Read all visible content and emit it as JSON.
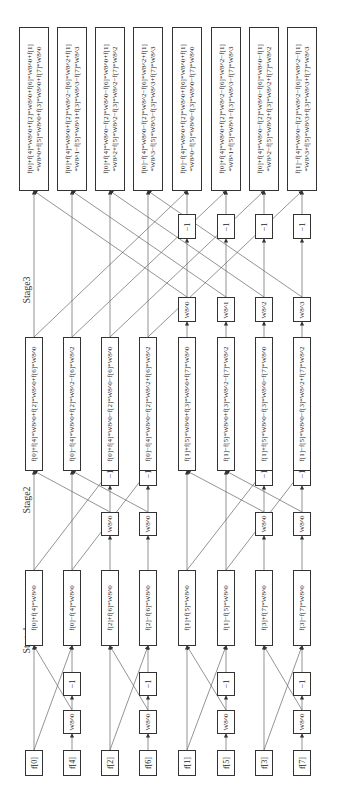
{
  "stages": {
    "stage1": "Stage1",
    "stage2": "Stage2",
    "stage3": "Stage3"
  },
  "inputs": [
    "f[0]",
    "f[4]",
    "f[2]",
    "f[6]",
    "f[1]",
    "f[5]",
    "f[3]",
    "f[7]"
  ],
  "stage1": {
    "twiddles": [
      "W8^0",
      "W8^0",
      "W8^0",
      "W8^0"
    ],
    "neg": [
      "−1",
      "−1",
      "−1",
      "−1"
    ],
    "outputs": [
      "f[0]+f[4]*W8^0",
      "f[0]−f[4]*W8^0",
      "f[2]+f[6]*W8^0",
      "f[2]−f[6]*W8^0",
      "f[1]+f[5]*W8^0",
      "f[1]−f[5]*W8^0",
      "f[3]+f[7]*W8^0",
      "f[3]−f[7]*W8^0"
    ]
  },
  "stage2": {
    "twiddles": [
      "W8^0",
      "W8^0",
      "W8^0",
      "W8^0"
    ],
    "neg": [
      "−1",
      "−1",
      "−1",
      "−1"
    ],
    "outputs": [
      "f[0]+f[4]*W8^0+f[2]*W8^0+f[6]*W8^0",
      "f[0]−f[4]*W8^0+f[2]*W8^2−f[6]*W8^2",
      "f[0]+f[4]*W8^0−f[2]*W8^0−f[6]*W8^0",
      "f[0]−f[4]*W8^0−f[2]*W8^2+f[6]*W8^2",
      "f[1]+f[5]*W8^0+f[3]*W8^0+f[7]*W8^0",
      "f[1]−f[5]*W8^0+f[3]*W8^2−f[7]*W8^2",
      "f[1]+f[5]*W8^0−f[3]*W8^0−f[7]*W8^0",
      "f[1]−f[5]*W8^0−f[3]*W8^2+f[7]*W8^2"
    ]
  },
  "stage3": {
    "twiddles": [
      "W8^0",
      "W8^1",
      "W8^2",
      "W8^3"
    ],
    "neg": [
      "−1",
      "−1",
      "−1",
      "−1"
    ],
    "outputs": [
      {
        "line1": "f[0]+f[4]*W8^0+f[2]*W8^0+f[6]*W8^0+f[1]",
        "line2": "*W8^0+f[5]*W8^0+f[3]*W8^0+f[7]*W8^0"
      },
      {
        "line1": "f[0]+f[4]*W8^0+f[2]*W8^2−f[6]*W8^2+f[1]",
        "line2": "*W8^1−f[5]*W8^1+f[3]*W8^3−f[7]*W8^3"
      },
      {
        "line1": "f[0]+f[4]*W8^0−f[2]*W8^0−f[6]*W8^0+f[1]",
        "line2": "*W8^2+f[5]*W8^2−f[3]*W8^2−f[7]*W8^2"
      },
      {
        "line1": "f[0]−f[4]*W8^0−f[2]*W8^2−f[6]*W8^2+f[1]",
        "line2": "*W8^3−f[5]*W8^3−f[3]*W8^3+f[7]*W8^3"
      },
      {
        "line1": "f[0]−f[4]*W8^0+f[2]*W8^0+f[6]*W8^0+f[1]",
        "line2": "*W8^0−f[5]*W8^0−f[3]*W8^0−f[7]*W8^0"
      },
      {
        "line1": "f[0]+f[4]*W8^0+f[2]*W8^2−f[6]*W8^2−f[1]",
        "line2": "*W8^1+f[5]*W8^1−f[3]*W8^3−f[7]*W8^3"
      },
      {
        "line1": "f[0]+f[4]*W8^0−f[2]*W8^0−f[6]*W8^0−f[1]",
        "line2": "*W8^2−f[5]*W8^2+f[3]*W8^2+f[7]*W8^2"
      },
      {
        "line1": "f[1]−f[4]*W8^0−f[2]*W8^2−f[6]*W8^2−f[1]",
        "line2": "*W8^3+f[5]*W8^3+f[3]*W8^3+f[7]*W8^3"
      }
    ]
  }
}
